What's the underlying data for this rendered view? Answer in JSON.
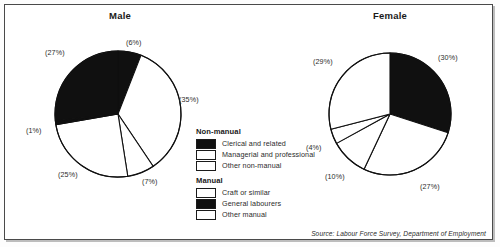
{
  "figure": {
    "source_note": "Source: Labour Force Survey, Department of Employment"
  },
  "legend": {
    "groups": [
      {
        "title": "Non-manual",
        "items": [
          {
            "label": "Clerical and related",
            "fill": "#101010",
            "swatch": "filled"
          },
          {
            "label": "Managerial and professional",
            "fill": "#ffffff",
            "swatch": "empty"
          },
          {
            "label": "Other non-manual",
            "fill": "#ffffff",
            "swatch": "empty"
          }
        ]
      },
      {
        "title": "Manual",
        "items": [
          {
            "label": "Craft or similar",
            "fill": "#ffffff",
            "swatch": "empty"
          },
          {
            "label": "General labourers",
            "fill": "#101010",
            "swatch": "filled"
          },
          {
            "label": "Other manual",
            "fill": "#ffffff",
            "swatch": "empty"
          }
        ]
      }
    ]
  },
  "chart_data": [
    {
      "type": "pie",
      "title": "Male",
      "categories": [
        "Clerical and related",
        "Managerial and professional",
        "Other non-manual",
        "Craft or similar",
        "General labourers",
        "Other manual"
      ],
      "values": [
        6,
        35,
        7,
        25,
        1,
        27
      ],
      "labels": [
        "(6%)",
        "(35%)",
        "(7%)",
        "(25%)",
        "(1%)",
        "(27%)"
      ],
      "fills": [
        "#101010",
        "#ffffff",
        "#ffffff",
        "#ffffff",
        "#101010",
        "#101010"
      ],
      "start_angle_deg": 0,
      "direction": "clockwise",
      "legend_position": "center",
      "label_positions": [
        {
          "text": "(6%)",
          "left": 126,
          "top": 38
        },
        {
          "text": "(35%)",
          "left": 179,
          "top": 95
        },
        {
          "text": "(7%)",
          "left": 142,
          "top": 177
        },
        {
          "text": "(25%)",
          "left": 58,
          "top": 170
        },
        {
          "text": "(1%)",
          "left": 26,
          "top": 126
        },
        {
          "text": "(27%)",
          "left": 45,
          "top": 48
        }
      ]
    },
    {
      "type": "pie",
      "title": "Female",
      "categories": [
        "Clerical and related",
        "Managerial and professional",
        "Other non-manual",
        "Craft or similar",
        "Other manual"
      ],
      "values": [
        30,
        27,
        10,
        4,
        29
      ],
      "labels": [
        "(30%)",
        "(27%)",
        "(10%)",
        "(4%)",
        "(29%)"
      ],
      "fills": [
        "#101010",
        "#ffffff",
        "#ffffff",
        "#ffffff",
        "#ffffff"
      ],
      "start_angle_deg": 0,
      "direction": "clockwise",
      "legend_position": "center",
      "label_positions": [
        {
          "text": "(30%)",
          "left": 438,
          "top": 53
        },
        {
          "text": "(27%)",
          "left": 420,
          "top": 182
        },
        {
          "text": "(10%)",
          "left": 325,
          "top": 172
        },
        {
          "text": "(4%)",
          "left": 306,
          "top": 143
        },
        {
          "text": "(29%)",
          "left": 313,
          "top": 57
        }
      ]
    }
  ]
}
